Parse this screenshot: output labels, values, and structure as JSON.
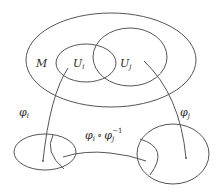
{
  "diagram": {
    "title": "",
    "colors": {
      "stroke": "#555555",
      "text": "#2a2a2a",
      "background": "#ffffff"
    },
    "manifold": {
      "label": "M"
    },
    "charts": [
      {
        "id": "Ui",
        "label": "U",
        "sub": "i"
      },
      {
        "id": "Uj",
        "label": "U",
        "sub": "j"
      }
    ],
    "maps": [
      {
        "id": "phi_i",
        "label": "φ",
        "sub": "i"
      },
      {
        "id": "phi_j",
        "label": "φ",
        "sub": "j"
      },
      {
        "id": "transition",
        "label": "φ",
        "sub": "i",
        "op": "∘",
        "label2": "φ",
        "sub2": "j",
        "sup2": "−1"
      }
    ]
  }
}
